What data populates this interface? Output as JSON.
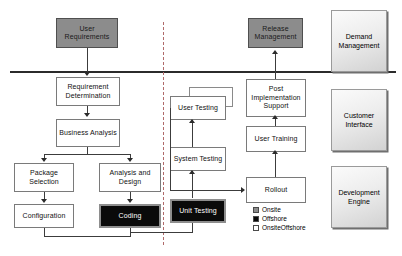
{
  "diagram": {
    "divider_label": "phase-divider",
    "colors": {
      "onsite": "#8c8c8c",
      "offshore": "#0a0a0a",
      "onsite_offshore": "#ffffff",
      "panel_border": "#9a9a9a",
      "connector": "#2b2b2b",
      "divider": "#b06a6a"
    },
    "boxes": [
      {
        "id": "user-requirements",
        "label": "User Requirements",
        "type": "Onsite"
      },
      {
        "id": "requirement-determination",
        "label": "Requirement Determination",
        "type": "OnsiteOffshore"
      },
      {
        "id": "business-analysis",
        "label": "Business Analysis",
        "type": "OnsiteOffshore"
      },
      {
        "id": "package-selection",
        "label": "Package Selection",
        "type": "OnsiteOffshore"
      },
      {
        "id": "analysis-and-design",
        "label": "Analysis and Design",
        "type": "OnsiteOffshore"
      },
      {
        "id": "configuration",
        "label": "Configuration",
        "type": "OnsiteOffshore"
      },
      {
        "id": "coding",
        "label": "Coding",
        "type": "Offshore"
      },
      {
        "id": "unit-testing",
        "label": "Unit Testing",
        "type": "Offshore"
      },
      {
        "id": "system-testing",
        "label": "System Testing",
        "type": "OnsiteOffshore"
      },
      {
        "id": "user-testing",
        "label": "User Testing",
        "type": "OnsiteOffshore"
      },
      {
        "id": "rollout",
        "label": "Rollout",
        "type": "OnsiteOffshore"
      },
      {
        "id": "user-training",
        "label": "User Training",
        "type": "OnsiteOffshore"
      },
      {
        "id": "post-implementation-support",
        "label": "Post Implementation Support",
        "type": "OnsiteOffshore"
      },
      {
        "id": "release-management",
        "label": "Release Management",
        "type": "Onsite"
      }
    ],
    "panels": [
      {
        "id": "demand-management",
        "label": "Demand Management"
      },
      {
        "id": "customer-interface",
        "label": "Customer Interface"
      },
      {
        "id": "development-engine",
        "label": "Development Engine"
      }
    ],
    "legend": {
      "items": [
        {
          "swatch": "grey",
          "label": "Onsite"
        },
        {
          "swatch": "black",
          "label": "Offshore"
        },
        {
          "swatch": "white",
          "label": "OnsiteOffshore"
        }
      ]
    }
  }
}
